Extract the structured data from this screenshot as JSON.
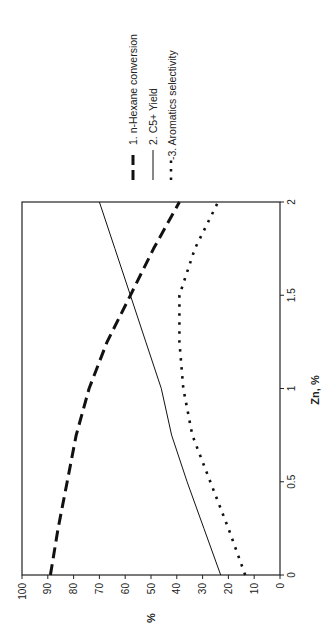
{
  "chart_data": {
    "type": "line",
    "orientation": "rotated-90-ccw",
    "title": "",
    "xlabel": "Zn, %",
    "ylabel": "%",
    "xlim": [
      0,
      2
    ],
    "ylim": [
      0,
      100
    ],
    "x_ticks": [
      "0",
      "0.5",
      "1",
      "1.5",
      "2"
    ],
    "y_ticks": [
      "0",
      "10",
      "20",
      "30",
      "40",
      "50",
      "60",
      "70",
      "80",
      "90",
      "100"
    ],
    "grid": false,
    "legend_position": "top (right of plot when rotated)",
    "x": [
      0,
      0.25,
      0.5,
      0.75,
      1,
      1.25,
      1.5,
      1.75,
      2
    ],
    "series": [
      {
        "name": "1. n-Hexane conversion",
        "style": "dashed-thick",
        "values": [
          89,
          86,
          82.5,
          79,
          74,
          67,
          58,
          49,
          39
        ]
      },
      {
        "name": "2. C5+ Yield",
        "style": "solid",
        "values": [
          23,
          29.5,
          36,
          42,
          46,
          52,
          58,
          64,
          70
        ]
      },
      {
        "name": "3. Aromatics selectivity",
        "style": "dotted",
        "values": [
          13.5,
          20,
          27,
          34,
          37.5,
          39,
          39,
          33,
          24
        ]
      }
    ]
  },
  "legend": {
    "items": [
      {
        "label": "1. n-Hexane conversion"
      },
      {
        "label": "2. C5+ Yield"
      },
      {
        "label": "-3. Aromatics selectivity"
      }
    ]
  },
  "axes": {
    "x_title": "Zn, %",
    "y_title": "%"
  }
}
